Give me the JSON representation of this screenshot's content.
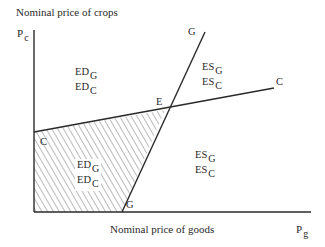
{
  "title": "Nominal price of crops",
  "x_axis": {
    "label": "Nominal price of goods",
    "symbol": "P",
    "symbol_sub": "g"
  },
  "y_axis": {
    "label": "Nominal price of crops",
    "symbol": "P",
    "symbol_sub": "c"
  },
  "lines": {
    "C": {
      "label_start": "C",
      "label_end": "C"
    },
    "G": {
      "label_start": "G",
      "label_end": "G"
    }
  },
  "equilibrium": {
    "label": "E"
  },
  "regions": {
    "upper_left": {
      "line1": {
        "main": "ED",
        "sub": "G"
      },
      "line2": {
        "main": "ED",
        "sub": "C"
      }
    },
    "upper_right": {
      "line1": {
        "main": "ES",
        "sub": "G"
      },
      "line2": {
        "main": "ES",
        "sub": "C"
      }
    },
    "lower_left_hatched": {
      "line1": {
        "main": "ED",
        "sub": "G"
      },
      "line2": {
        "main": "ED",
        "sub": "C"
      }
    },
    "lower_right": {
      "line1": {
        "main": "ES",
        "sub": "G"
      },
      "line2": {
        "main": "ES",
        "sub": "C"
      }
    }
  },
  "colors": {
    "line": "#2a2a2a",
    "hatch": "#555555",
    "background": "#ffffff"
  }
}
